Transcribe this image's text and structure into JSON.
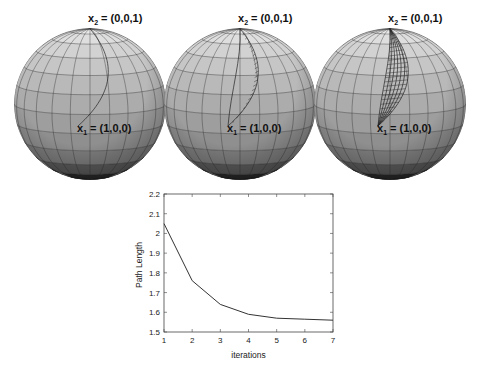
{
  "figure": {
    "spheres": [
      {
        "id": "sphere-1",
        "cx": 90,
        "cy": 104,
        "r": 76,
        "iterations_shown": 1,
        "label_top": {
          "base": "x",
          "sub": "2",
          "text": " = (0,0,1)"
        },
        "label_mid": {
          "base": "x",
          "sub": "1",
          "text": " = (1,0,0)"
        }
      },
      {
        "id": "sphere-2",
        "cx": 240,
        "cy": 104,
        "r": 76,
        "iterations_shown": 2,
        "label_top": {
          "base": "x",
          "sub": "2",
          "text": " = (0,0,1)"
        },
        "label_mid": {
          "base": "x",
          "sub": "1",
          "text": " = (1,0,0)"
        }
      },
      {
        "id": "sphere-3",
        "cx": 390,
        "cy": 104,
        "r": 76,
        "iterations_shown": 7,
        "label_top": {
          "base": "x",
          "sub": "2",
          "text": " = (0,0,1)"
        },
        "label_mid": {
          "base": "x",
          "sub": "1",
          "text": " = (1,0,0)"
        }
      }
    ],
    "band_colors": [
      "#e9e9e9",
      "#dedede",
      "#d2d2d2",
      "#c6c6c6",
      "#b9b9b9",
      "#acacac",
      "#9e9e9e",
      "#8f8f8f",
      "#7d7d7d",
      "#5c5c5c",
      "#2a2a2a",
      "#0c0c0c"
    ]
  },
  "chart_data": {
    "type": "line",
    "title": "",
    "xlabel": "iterations",
    "ylabel": "Path Length",
    "x": [
      1,
      2,
      3,
      4,
      5,
      6,
      7
    ],
    "series": [
      {
        "name": "Path Length",
        "values": [
          2.05,
          1.76,
          1.64,
          1.59,
          1.57,
          1.565,
          1.56
        ]
      }
    ],
    "xlim": [
      1,
      7
    ],
    "ylim": [
      1.5,
      2.2
    ],
    "xticks": [
      "1",
      "2",
      "3",
      "4",
      "5",
      "6",
      "7"
    ],
    "yticks": [
      "1.5",
      "1.6",
      "1.7",
      "1.8",
      "1.9",
      "2",
      "2.1",
      "2.2"
    ],
    "grid": false,
    "legend": null
  }
}
